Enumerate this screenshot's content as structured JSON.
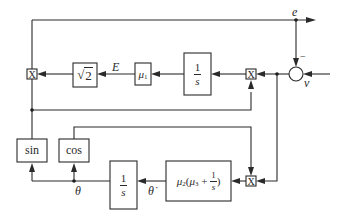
{
  "diagram": {
    "type": "block-diagram",
    "signals": {
      "e": "e",
      "v": "v",
      "E": "E",
      "theta": "θ",
      "theta_dot": "θ̇",
      "minus_sign": "−"
    },
    "blocks": {
      "integrator_top": {
        "num": "1",
        "den": "s"
      },
      "mu1": {
        "base": "μ",
        "sub": "1"
      },
      "sqrt2": {
        "radical": "√",
        "value": "2"
      },
      "sin": "sin",
      "cos": "cos",
      "integrator_bottom": {
        "num": "1",
        "den": "s"
      },
      "pi_controller": {
        "mu2": "μ",
        "mu2_sub": "2",
        "open": "(",
        "mu3": "μ",
        "mu3_sub": "3",
        "plus": " + ",
        "num": "1",
        "den": "s",
        "close": ")"
      }
    },
    "multipliers": {
      "left": "X",
      "right_top": "X",
      "bottom": "X"
    },
    "colors": {
      "line": "#2a2a2a",
      "background": "#ffffff"
    }
  }
}
